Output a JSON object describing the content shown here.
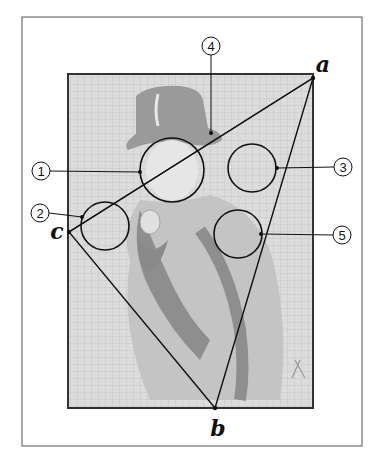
{
  "figure": {
    "frame": {
      "x": 22,
      "y": 17,
      "width": 340,
      "height": 429,
      "stroke": "#555555"
    },
    "poster": {
      "x": 68,
      "y": 74,
      "width": 245,
      "height": 334,
      "fill": "#d6d6d6",
      "border": "#333333"
    },
    "vertices": [
      {
        "id": "a",
        "label": "a",
        "x": 313,
        "y": 78,
        "label_x": 323,
        "label_y": 64
      },
      {
        "id": "b",
        "label": "b",
        "x": 215,
        "y": 408,
        "label_x": 218,
        "label_y": 428
      },
      {
        "id": "c",
        "label": "c",
        "x": 69,
        "y": 232,
        "label_x": 57,
        "label_y": 231
      }
    ],
    "callouts": [
      {
        "number": "1",
        "circle": {
          "cx": 172,
          "cy": 170,
          "r": 32
        },
        "anchor": {
          "x": 140,
          "y": 172
        },
        "badge": {
          "cx": 41,
          "cy": 171
        }
      },
      {
        "number": "2",
        "circle": {
          "cx": 105,
          "cy": 226,
          "r": 24
        },
        "anchor": {
          "x": 82,
          "y": 217
        },
        "badge": {
          "cx": 40,
          "cy": 213
        }
      },
      {
        "number": "3",
        "circle": {
          "cx": 252,
          "cy": 168,
          "r": 24
        },
        "anchor": {
          "x": 277,
          "y": 168
        },
        "badge": {
          "cx": 343,
          "cy": 167
        }
      },
      {
        "number": "4",
        "circle": null,
        "anchor": {
          "x": 211,
          "y": 133
        },
        "badge": {
          "cx": 211,
          "cy": 46
        }
      },
      {
        "number": "5",
        "circle": {
          "cx": 238,
          "cy": 234,
          "r": 24
        },
        "anchor": {
          "x": 261,
          "y": 234
        },
        "badge": {
          "cx": 342,
          "cy": 235
        }
      }
    ]
  }
}
